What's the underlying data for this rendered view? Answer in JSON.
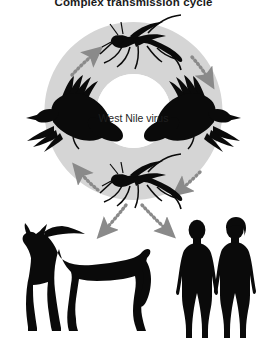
{
  "figure": {
    "title": "Complex transmission cycle",
    "center_label": "West Nile virus",
    "background_color": "#ffffff",
    "ring_color": "#d5d5d5",
    "silhouette_color": "#0a0a0a",
    "arrow_color": "#808080",
    "title_color": "#1a1a1a"
  },
  "diagram_data": {
    "type": "cycle-diagram",
    "subject": "West Nile virus",
    "amplification_cycle": {
      "shape": "ring",
      "nodes": [
        {
          "id": "mosquito-top",
          "label": "mosquito",
          "icon": "mosquito-icon",
          "position": "top"
        },
        {
          "id": "bird-right",
          "label": "bird (crow)",
          "icon": "bird-icon",
          "position": "right"
        },
        {
          "id": "mosquito-bottom",
          "label": "mosquito",
          "icon": "mosquito-icon",
          "position": "bottom"
        },
        {
          "id": "bird-left",
          "label": "bird (crow)",
          "icon": "bird-icon",
          "position": "left"
        }
      ],
      "edges": [
        {
          "from": "mosquito-top",
          "to": "bird-right",
          "style": "dashed",
          "direction": "clockwise"
        },
        {
          "from": "bird-right",
          "to": "mosquito-bottom",
          "style": "dashed",
          "direction": "clockwise"
        },
        {
          "from": "mosquito-bottom",
          "to": "bird-left",
          "style": "dashed",
          "direction": "clockwise"
        },
        {
          "from": "bird-left",
          "to": "mosquito-top",
          "style": "dashed",
          "direction": "clockwise"
        }
      ]
    },
    "dead_end_hosts": [
      {
        "id": "horse",
        "label": "horse",
        "icon": "horse-icon",
        "position": "bottom-left",
        "count": 1
      },
      {
        "id": "humans",
        "label": "humans",
        "icon": "human-icon",
        "position": "bottom-right",
        "count": 2
      }
    ],
    "spillover_edges": [
      {
        "from": "mosquito-bottom",
        "to": "horse",
        "style": "dashed"
      },
      {
        "from": "mosquito-bottom",
        "to": "humans",
        "style": "dashed"
      }
    ],
    "legend": [],
    "annotations": []
  }
}
